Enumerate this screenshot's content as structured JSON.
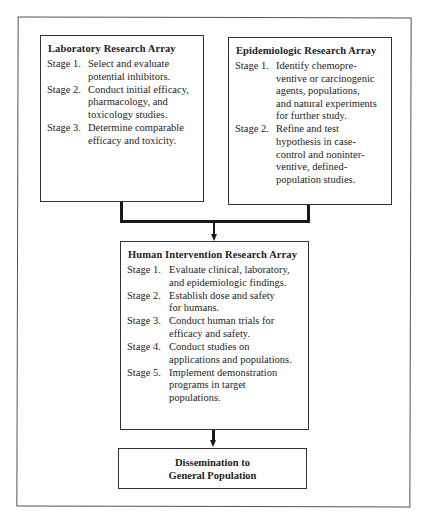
{
  "diagram": {
    "type": "flowchart",
    "boxes": {
      "laboratory": {
        "title": "Laboratory Research Array",
        "stages": [
          {
            "label": "Stage 1.",
            "text": "Select and evaluate\npotential inhibitors."
          },
          {
            "label": "Stage 2.",
            "text": "Conduct initial efficacy,\npharmacology, and\ntoxicology studies."
          },
          {
            "label": "Stage 3.",
            "text": "Determine comparable\nefficacy and toxicity."
          }
        ]
      },
      "epidemiologic": {
        "title": "Epidemiologic Research Array",
        "stages": [
          {
            "label": "Stage 1.",
            "text": "Identify chemopre-\nventive or carcinogenic\nagents, populations,\nand natural experiments\nfor further study."
          },
          {
            "label": "Stage 2.",
            "text": "Refine and test\nhypothesis in case-\ncontrol and noninter-\nventive, defined-\npopulation studies."
          }
        ]
      },
      "human_intervention": {
        "title": "Human Intervention Research Array",
        "stages": [
          {
            "label": "Stage 1.",
            "text": "Evaluate clinical, laboratory,\nand epidemiologic findings."
          },
          {
            "label": "Stage 2.",
            "text": "Establish dose and safety\nfor humans."
          },
          {
            "label": "Stage 3.",
            "text": "Conduct human trials for\nefficacy and safety."
          },
          {
            "label": "Stage 4.",
            "text": "Conduct studies on\napplications and populations."
          },
          {
            "label": "Stage 5.",
            "text": "Implement demonstration\nprograms in target\npopulations."
          }
        ]
      },
      "dissemination": {
        "title": "Dissemination to\nGeneral Population"
      }
    },
    "edges": [
      {
        "from": "laboratory",
        "to": "human_intervention"
      },
      {
        "from": "epidemiologic",
        "to": "human_intervention"
      },
      {
        "from": "human_intervention",
        "to": "dissemination"
      }
    ]
  }
}
